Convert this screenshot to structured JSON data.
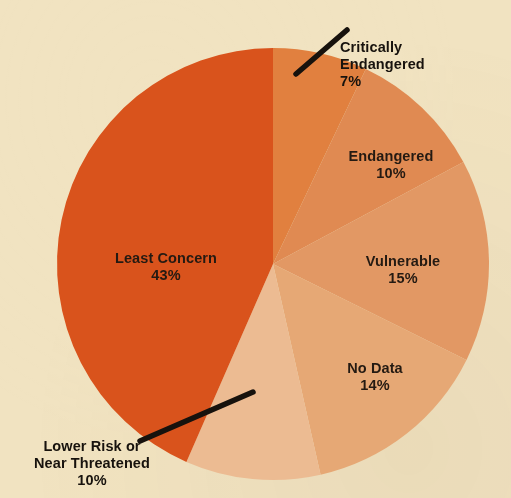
{
  "title": "STATUS OF SHARKS AND RAYS",
  "background_color": "#f1e3c1",
  "title_color": "#cf4a1e",
  "label_color": "#2e2118",
  "leader_line_color": "#17120d",
  "chart_data": {
    "type": "pie",
    "title": "STATUS OF SHARKS AND RAYS",
    "xlabel": "",
    "ylabel": "",
    "legend": "none",
    "grid": false,
    "start_angle_deg": 0,
    "direction": "clockwise",
    "categories": [
      "Critically Endangered",
      "Endangered",
      "Vulnerable",
      "No Data",
      "Lower Risk or Near Threatened",
      "Least Concern"
    ],
    "values": [
      7,
      10,
      15,
      14,
      10,
      43
    ],
    "value_unit": "%",
    "colors": [
      "#e1803f",
      "#e08a52",
      "#e29864",
      "#e6a875",
      "#ecbb92",
      "#d9531c"
    ],
    "slices": [
      {
        "name": "Critically Endangered",
        "label": "Critically\nEndangered",
        "percent": 7,
        "percent_text": "7%",
        "color": "#e1803f",
        "label_placement": "outside",
        "has_leader_line": true
      },
      {
        "name": "Endangered",
        "label": "Endangered",
        "percent": 10,
        "percent_text": "10%",
        "color": "#e08a52",
        "label_placement": "inside",
        "has_leader_line": false
      },
      {
        "name": "Vulnerable",
        "label": "Vulnerable",
        "percent": 15,
        "percent_text": "15%",
        "color": "#e29864",
        "label_placement": "inside",
        "has_leader_line": false
      },
      {
        "name": "No Data",
        "label": "No Data",
        "percent": 14,
        "percent_text": "14%",
        "color": "#e6a875",
        "label_placement": "inside",
        "has_leader_line": false
      },
      {
        "name": "Lower Risk or Near Threatened",
        "label": "Lower Risk or\nNear Threatened",
        "percent": 10,
        "percent_text": "10%",
        "color": "#ecbb92",
        "label_placement": "outside",
        "has_leader_line": true
      },
      {
        "name": "Least Concern",
        "label": "Least Concern",
        "percent": 43,
        "percent_text": "43%",
        "color": "#d9531c",
        "label_placement": "inside",
        "has_leader_line": false
      }
    ]
  },
  "geometry": {
    "center_x": 273,
    "center_y": 264,
    "radius": 216
  }
}
